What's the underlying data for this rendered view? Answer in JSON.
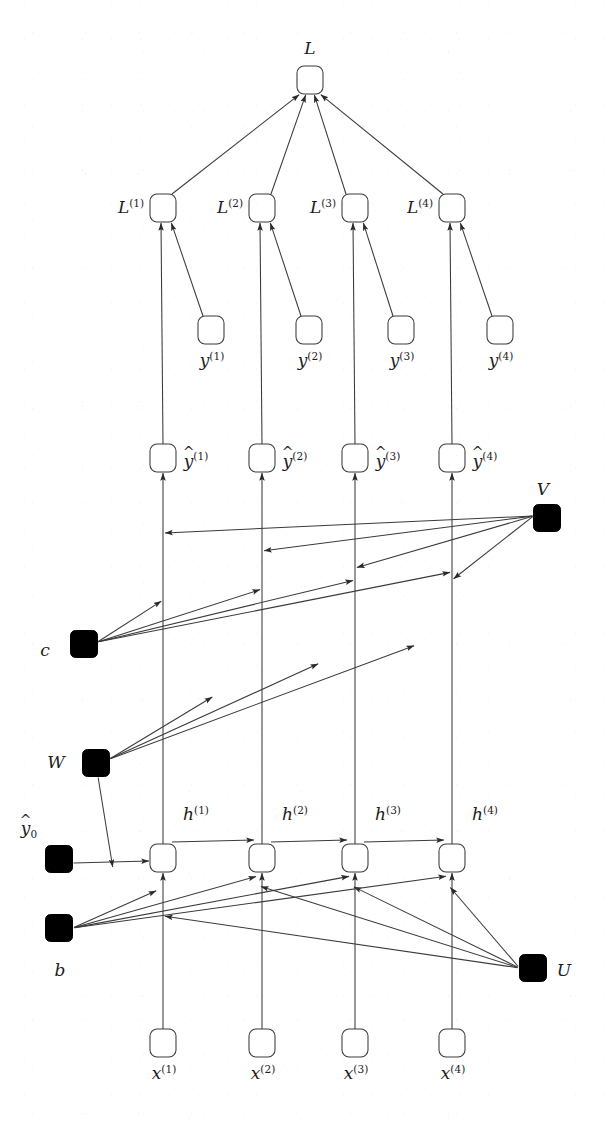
{
  "figure": {
    "background": "#ffffff",
    "ink_color": "#1c1c1c",
    "node_fill": "#ffffff",
    "node_stroke": "#3a3a3a",
    "param_fill": "#000000",
    "timesteps": 4
  },
  "nodes": {
    "loss_total": {
      "label": "L",
      "x": 310,
      "y": 80,
      "kind": "variable",
      "label_pos": "above"
    },
    "per_step_loss": [
      {
        "label": "L",
        "sup": "(1)",
        "x": 163,
        "y": 208,
        "kind": "variable",
        "label_pos": "left"
      },
      {
        "label": "L",
        "sup": "(2)",
        "x": 262,
        "y": 208,
        "kind": "variable",
        "label_pos": "left"
      },
      {
        "label": "L",
        "sup": "(3)",
        "x": 355,
        "y": 208,
        "kind": "variable",
        "label_pos": "left"
      },
      {
        "label": "L",
        "sup": "(4)",
        "x": 452,
        "y": 208,
        "kind": "variable",
        "label_pos": "left"
      }
    ],
    "targets": [
      {
        "label": "y",
        "sup": "(1)",
        "x": 211,
        "y": 330,
        "kind": "variable",
        "label_pos": "below"
      },
      {
        "label": "y",
        "sup": "(2)",
        "x": 309,
        "y": 330,
        "kind": "variable",
        "label_pos": "below"
      },
      {
        "label": "y",
        "sup": "(3)",
        "x": 401,
        "y": 330,
        "kind": "variable",
        "label_pos": "below"
      },
      {
        "label": "y",
        "sup": "(4)",
        "x": 500,
        "y": 330,
        "kind": "variable",
        "label_pos": "below"
      }
    ],
    "predictions": [
      {
        "label": "y",
        "sup": "(1)",
        "hat": true,
        "x": 163,
        "y": 458,
        "kind": "variable",
        "label_pos": "right"
      },
      {
        "label": "y",
        "sup": "(2)",
        "hat": true,
        "x": 262,
        "y": 458,
        "kind": "variable",
        "label_pos": "right"
      },
      {
        "label": "y",
        "sup": "(3)",
        "hat": true,
        "x": 355,
        "y": 458,
        "kind": "variable",
        "label_pos": "right"
      },
      {
        "label": "y",
        "sup": "(4)",
        "hat": true,
        "x": 452,
        "y": 458,
        "kind": "variable",
        "label_pos": "right"
      }
    ],
    "hidden": [
      {
        "label": "h",
        "sup": "(1)",
        "x": 163,
        "y": 858,
        "kind": "variable",
        "label_pos": "upper-right"
      },
      {
        "label": "h",
        "sup": "(2)",
        "x": 262,
        "y": 858,
        "kind": "variable",
        "label_pos": "upper-right"
      },
      {
        "label": "h",
        "sup": "(3)",
        "x": 355,
        "y": 858,
        "kind": "variable",
        "label_pos": "upper-right"
      },
      {
        "label": "h",
        "sup": "(4)",
        "x": 452,
        "y": 858,
        "kind": "variable",
        "label_pos": "upper-right"
      }
    ],
    "inputs": [
      {
        "label": "x",
        "sup": "(1)",
        "x": 163,
        "y": 1043,
        "kind": "variable",
        "label_pos": "below"
      },
      {
        "label": "x",
        "sup": "(2)",
        "x": 262,
        "y": 1043,
        "kind": "variable",
        "label_pos": "below"
      },
      {
        "label": "x",
        "sup": "(3)",
        "x": 355,
        "y": 1043,
        "kind": "variable",
        "label_pos": "below"
      },
      {
        "label": "x",
        "sup": "(4)",
        "x": 452,
        "y": 1043,
        "kind": "variable",
        "label_pos": "below"
      }
    ],
    "parameters": [
      {
        "name": "V",
        "label": "V",
        "x": 547,
        "y": 518,
        "kind": "parameter",
        "label_pos": "above"
      },
      {
        "name": "c",
        "label": "c",
        "x": 84,
        "y": 644,
        "kind": "parameter",
        "label_pos": "below-left"
      },
      {
        "name": "W",
        "label": "W",
        "x": 96,
        "y": 763,
        "kind": "parameter",
        "label_pos": "left"
      },
      {
        "name": "h0",
        "label": "y",
        "sub": "0",
        "hat": true,
        "x": 59,
        "y": 859,
        "kind": "parameter",
        "label_pos": "above-left"
      },
      {
        "name": "b",
        "label": "b",
        "x": 59,
        "y": 928,
        "kind": "parameter",
        "label_pos": "below"
      },
      {
        "name": "U",
        "label": "U",
        "x": 533,
        "y": 968,
        "kind": "parameter",
        "label_pos": "right"
      }
    ]
  },
  "edges": {
    "description": "Directed arrows of the unfolded recurrent network computational graph",
    "groups": [
      {
        "name": "per-step-loss-to-total-loss",
        "count": 4,
        "from": "L^(t)",
        "to": "L"
      },
      {
        "name": "target-to-per-step-loss",
        "count": 4,
        "from": "y^(t)",
        "to": "L^(t)"
      },
      {
        "name": "prediction-to-per-step-loss",
        "count": 4,
        "from": "yhat^(t)",
        "to": "L^(t)"
      },
      {
        "name": "hidden-to-prediction",
        "count": 4,
        "from": "h^(t)",
        "to": "yhat^(t)"
      },
      {
        "name": "V-to-prediction",
        "count": 4,
        "from": "V",
        "to": "yhat^(t)"
      },
      {
        "name": "c-to-prediction",
        "count": 4,
        "from": "c",
        "to": "yhat^(t)"
      },
      {
        "name": "recurrent-hidden-to-hidden",
        "count": 3,
        "from": "h^(t-1)",
        "to": "h^(t)"
      },
      {
        "name": "W-to-recurrent-edge",
        "count": 4,
        "from": "W",
        "to": "h^(t)"
      },
      {
        "name": "initial-state-to-first-hidden",
        "count": 1,
        "from": "yhat_0",
        "to": "h^(1)"
      },
      {
        "name": "b-to-hidden",
        "count": 4,
        "from": "b",
        "to": "h^(t)"
      },
      {
        "name": "U-to-hidden",
        "count": 4,
        "from": "U",
        "to": "h^(t)"
      },
      {
        "name": "input-to-hidden",
        "count": 4,
        "from": "x^(t)",
        "to": "h^(t)"
      }
    ]
  }
}
